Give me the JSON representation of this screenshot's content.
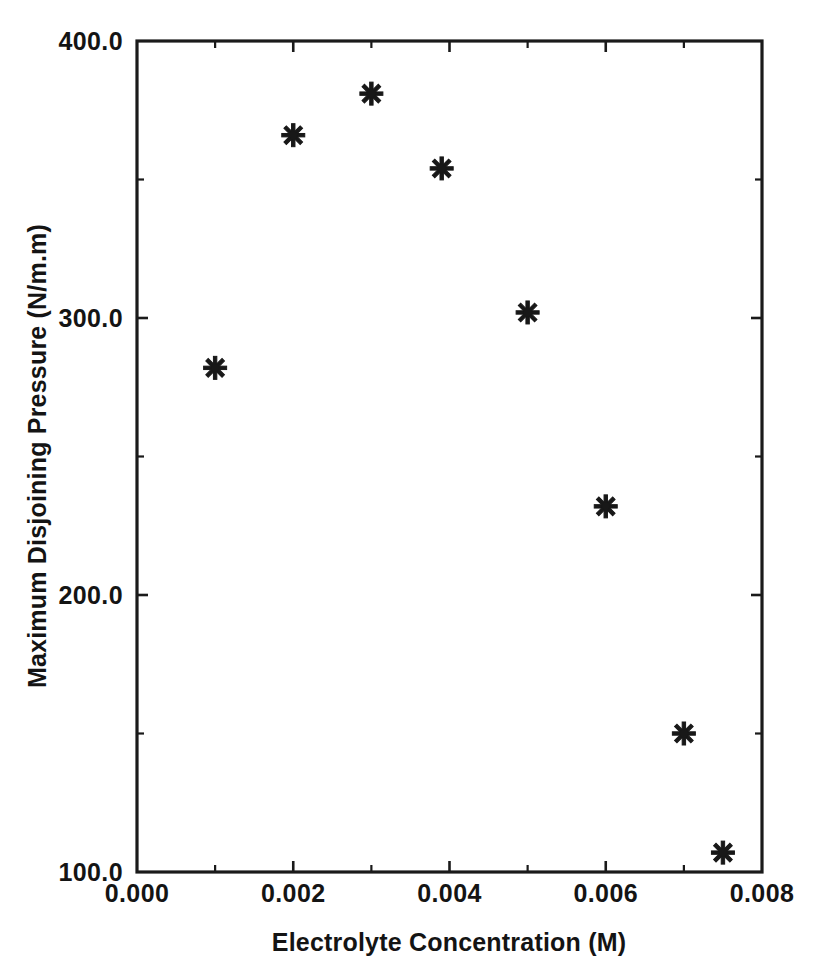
{
  "chart_data": {
    "type": "scatter",
    "title": "",
    "xlabel": "Electrolyte Concentration (M)",
    "ylabel": "Maximum Disjoining Pressure (N/m.m)",
    "xlim": [
      0.0,
      0.008
    ],
    "ylim": [
      100.0,
      400.0
    ],
    "grid": false,
    "legend": null,
    "marker": "asterisk",
    "marker_color": "#181818",
    "x": [
      0.001,
      0.002,
      0.003,
      0.0039,
      0.005,
      0.006,
      0.007,
      0.0075
    ],
    "y": [
      282,
      366,
      381,
      354,
      302,
      232,
      150,
      107
    ],
    "points": [
      {
        "x": 0.001,
        "y": 282
      },
      {
        "x": 0.002,
        "y": 366
      },
      {
        "x": 0.003,
        "y": 381
      },
      {
        "x": 0.0039,
        "y": 354
      },
      {
        "x": 0.005,
        "y": 302
      },
      {
        "x": 0.006,
        "y": 232
      },
      {
        "x": 0.007,
        "y": 150
      },
      {
        "x": 0.0075,
        "y": 107
      }
    ],
    "xticks": [
      0.0,
      0.002,
      0.004,
      0.006,
      0.008
    ],
    "xticklabels": [
      "0.000",
      "0.002",
      "0.004",
      "0.006",
      "0.008"
    ],
    "xticks_minor": [
      0.001,
      0.003,
      0.005,
      0.007
    ],
    "yticks": [
      100.0,
      200.0,
      300.0,
      400.0
    ],
    "yticklabels": [
      "100.0",
      "200.0",
      "300.0",
      "400.0"
    ],
    "yticks_minor": [
      150.0,
      250.0,
      350.0
    ]
  },
  "axes": {
    "x_title": "Electrolyte Concentration (M)",
    "y_title": "Maximum Disjoining Pressure (N/m.m)",
    "x_labels": [
      "0.000",
      "0.002",
      "0.004",
      "0.006",
      "0.008"
    ],
    "y_labels": [
      "400.0",
      "300.0",
      "200.0",
      "100.0"
    ]
  },
  "colors": {
    "background": "#ffffff",
    "ink": "#1a1a1a",
    "marker": "#181818"
  }
}
